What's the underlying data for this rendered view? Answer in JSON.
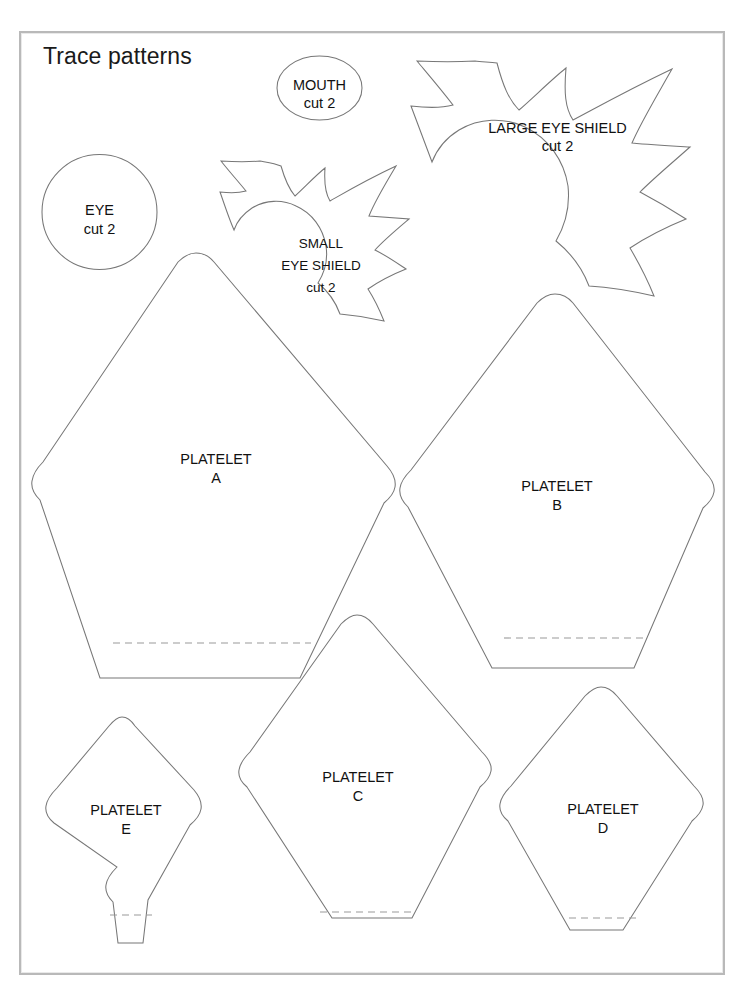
{
  "page": {
    "title": "Trace patterns",
    "background_color": "#ffffff",
    "frame_color": "#b9b9b9",
    "outline_color": "#777777",
    "seam_line_color": "#9a9a9a",
    "text_color": "#111111"
  },
  "patterns": [
    {
      "id": "eye",
      "name": "EYE",
      "quantity_label": "cut 2",
      "shape": "circle",
      "has_seam_line": false,
      "label_lines": [
        "EYE",
        "cut 2"
      ]
    },
    {
      "id": "mouth",
      "name": "MOUTH",
      "quantity_label": "cut 2",
      "shape": "ellipse",
      "has_seam_line": false,
      "label_lines": [
        "MOUTH",
        "cut 2"
      ]
    },
    {
      "id": "small-eye-shield",
      "name": "SMALL EYE SHIELD",
      "quantity_label": "cut 2",
      "shape": "starburst",
      "has_seam_line": false,
      "label_lines": [
        "SMALL",
        "EYE SHIELD",
        "cut 2"
      ]
    },
    {
      "id": "large-eye-shield",
      "name": "LARGE EYE SHIELD",
      "quantity_label": "cut 2",
      "shape": "starburst",
      "has_seam_line": false,
      "label_lines": [
        "LARGE EYE SHIELD",
        "cut 2"
      ]
    },
    {
      "id": "platelet-a",
      "name": "PLATELET",
      "letter": "A",
      "shape": "pentagon-kite",
      "has_seam_line": true,
      "label_lines": [
        "PLATELET",
        "A"
      ]
    },
    {
      "id": "platelet-b",
      "name": "PLATELET",
      "letter": "B",
      "shape": "pentagon-kite",
      "has_seam_line": true,
      "label_lines": [
        "PLATELET",
        "B"
      ]
    },
    {
      "id": "platelet-c",
      "name": "PLATELET",
      "letter": "C",
      "shape": "diamond-kite",
      "has_seam_line": true,
      "label_lines": [
        "PLATELET",
        "C"
      ]
    },
    {
      "id": "platelet-d",
      "name": "PLATELET",
      "letter": "D",
      "shape": "diamond-kite",
      "has_seam_line": true,
      "label_lines": [
        "PLATELET",
        "D"
      ]
    },
    {
      "id": "platelet-e",
      "name": "PLATELET",
      "letter": "E",
      "shape": "narrow-diamond-stem",
      "has_seam_line": true,
      "label_lines": [
        "PLATELET",
        "E"
      ]
    }
  ],
  "labels": {
    "eye_line1": "EYE",
    "eye_line2": "cut 2",
    "mouth_line1": "MOUTH",
    "mouth_line2": "cut 2",
    "small_shield_line1": "SMALL",
    "small_shield_line2": "EYE SHIELD",
    "small_shield_line3": "cut 2",
    "large_shield_line1": "LARGE EYE SHIELD",
    "large_shield_line2": "cut 2",
    "platelet_word": "PLATELET",
    "a": "A",
    "b": "B",
    "c": "C",
    "d": "D",
    "e": "E"
  }
}
